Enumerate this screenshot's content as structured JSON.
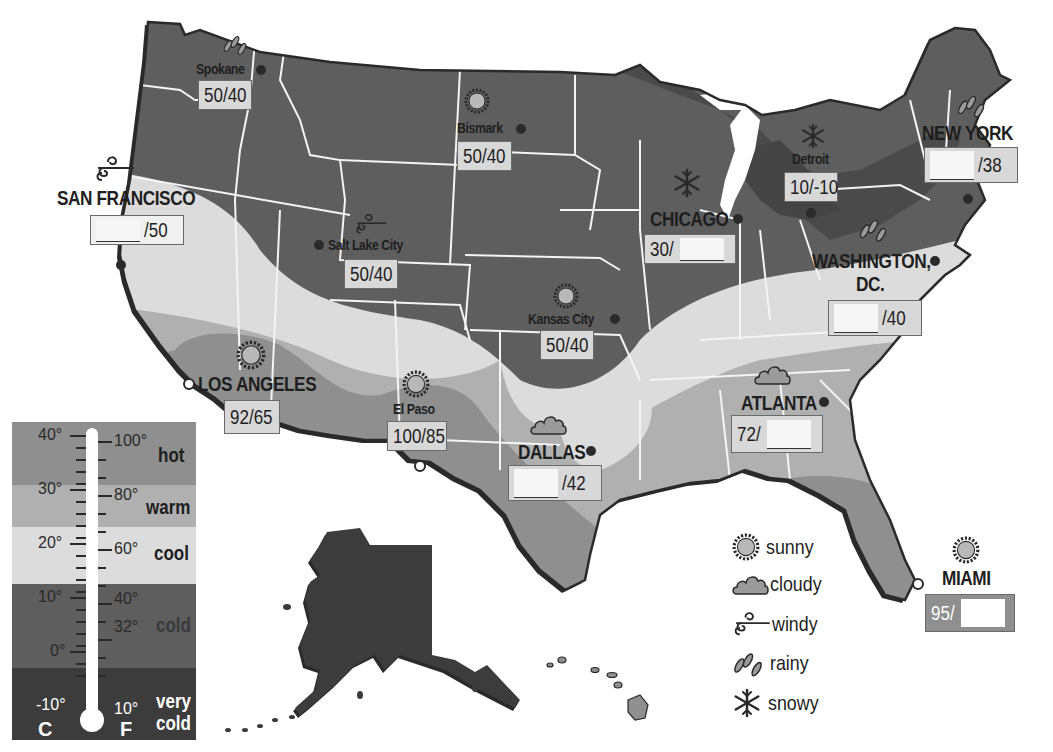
{
  "map": {
    "title": "United States Weather Map",
    "zone_colors": {
      "hot": "#8f8f8f",
      "warm": "#b0b0b0",
      "cool": "#dcdcdc",
      "cold": "#5e5e5e",
      "very_cold": "#3c3c3c"
    }
  },
  "cities": [
    {
      "id": "spokane",
      "name": "Spokane",
      "weather": "rainy",
      "high": "50",
      "low": "40",
      "size": "small"
    },
    {
      "id": "san-francisco",
      "name": "SAN FRANCISCO",
      "weather": "windy",
      "high": "",
      "low": "50",
      "size": "big"
    },
    {
      "id": "salt-lake-city",
      "name": "Salt Lake City",
      "weather": "windy",
      "high": "50",
      "low": "40",
      "size": "small"
    },
    {
      "id": "bismark",
      "name": "Bismark",
      "weather": "sunny",
      "high": "50",
      "low": "40",
      "size": "small"
    },
    {
      "id": "kansas-city",
      "name": "Kansas City",
      "weather": "sunny",
      "high": "50",
      "low": "40",
      "size": "small"
    },
    {
      "id": "chicago",
      "name": "CHICAGO",
      "weather": "snowy",
      "high": "30",
      "low": "",
      "size": "big"
    },
    {
      "id": "detroit",
      "name": "Detroit",
      "weather": "snowy",
      "high": "10",
      "low": "-10",
      "size": "small"
    },
    {
      "id": "new-york",
      "name": "NEW YORK",
      "weather": "rainy",
      "high": "",
      "low": "38",
      "size": "big"
    },
    {
      "id": "washington-dc",
      "name": "WASHINGTON, DC.",
      "name_line1": "WASHINGTON,",
      "name_line2": "DC.",
      "weather": "rainy",
      "high": "",
      "low": "40",
      "size": "big"
    },
    {
      "id": "los-angeles",
      "name": "LOS ANGELES",
      "weather": "sunny",
      "high": "92",
      "low": "65",
      "size": "big"
    },
    {
      "id": "el-paso",
      "name": "El Paso",
      "weather": "sunny",
      "high": "100",
      "low": "85",
      "size": "small"
    },
    {
      "id": "dallas",
      "name": "DALLAS",
      "weather": "cloudy",
      "high": "",
      "low": "42",
      "size": "big"
    },
    {
      "id": "atlanta",
      "name": "ATLANTA",
      "weather": "cloudy",
      "high": "72",
      "low": "",
      "size": "big"
    },
    {
      "id": "miami",
      "name": "MIAMI",
      "weather": "sunny",
      "high": "95",
      "low": "",
      "size": "big"
    }
  ],
  "temps": {
    "spokane": "50/40",
    "salt_lake_city": "50/40",
    "bismark": "50/40",
    "kansas_city": "50/40",
    "detroit": "10/-10",
    "los_angeles": "92/65",
    "el_paso": "100/85",
    "san_francisco_low": "/50",
    "chicago_high": "30/",
    "new_york_low": "/38",
    "washington_low": "/40",
    "dallas_low": "/42",
    "atlanta_high": "72/",
    "miami_high": "95/"
  },
  "labels": {
    "spokane": "Spokane",
    "san_francisco": "SAN FRANCISCO",
    "salt_lake_city": "Salt Lake City",
    "bismark": "Bismark",
    "kansas_city": "Kansas City",
    "chicago": "CHICAGO",
    "detroit": "Detroit",
    "new_york": "NEW YORK",
    "washington_1": "WASHINGTON,",
    "washington_2": "DC.",
    "los_angeles": "LOS ANGELES",
    "el_paso": "El Paso",
    "dallas": "DALLAS",
    "atlanta": "ATLANTA",
    "miami": "MIAMI"
  },
  "temperature_scale": {
    "celsius_ticks": [
      "40°",
      "30°",
      "20°",
      "10°",
      "0°",
      "-10°"
    ],
    "fahrenheit_ticks": [
      "100°",
      "80°",
      "60°",
      "40°",
      "32°",
      "10°"
    ],
    "celsius_label": "C",
    "fahrenheit_label": "F",
    "zones": [
      {
        "key": "hot",
        "label": "hot"
      },
      {
        "key": "warm",
        "label": "warm"
      },
      {
        "key": "cool",
        "label": "cool"
      },
      {
        "key": "cold",
        "label": "cold"
      },
      {
        "key": "very_cold",
        "label_line1": "very",
        "label_line2": "cold"
      }
    ]
  },
  "legend": {
    "items": [
      {
        "icon": "sunny-icon",
        "label": "sunny"
      },
      {
        "icon": "cloudy-icon",
        "label": "cloudy"
      },
      {
        "icon": "windy-icon",
        "label": "windy"
      },
      {
        "icon": "rainy-icon",
        "label": "rainy"
      },
      {
        "icon": "snowy-icon",
        "label": "snowy"
      }
    ]
  }
}
